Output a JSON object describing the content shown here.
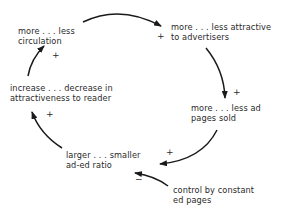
{
  "diagram": {
    "type": "causal-loop",
    "colors": {
      "stroke": "#1a1a1a",
      "text": "#2a2a2a",
      "background": "#ffffff"
    },
    "nodes": [
      {
        "id": "circulation",
        "lines": [
          "more . . . less",
          "circulation"
        ]
      },
      {
        "id": "advertisers",
        "lines": [
          "more . . . less attractive",
          "to advertisers"
        ]
      },
      {
        "id": "ad_pages",
        "lines": [
          "more . . . less ad",
          "pages sold"
        ]
      },
      {
        "id": "ratio",
        "lines": [
          "larger . . . smaller",
          "ad-ed ratio"
        ]
      },
      {
        "id": "reader",
        "lines": [
          "increase . . . decrease in",
          "attractiveness to reader"
        ]
      },
      {
        "id": "control",
        "lines": [
          "control by constant",
          "ed pages"
        ]
      }
    ],
    "links": [
      {
        "from": "circulation",
        "to": "advertisers",
        "sign": "+"
      },
      {
        "from": "advertisers",
        "to": "ad_pages",
        "sign": "+"
      },
      {
        "from": "ad_pages",
        "to": "ratio",
        "sign": "+"
      },
      {
        "from": "ratio",
        "to": "reader",
        "sign": "+"
      },
      {
        "from": "reader",
        "to": "circulation",
        "sign": "+"
      },
      {
        "from": "control",
        "to": "ratio",
        "sign": "−"
      }
    ]
  }
}
